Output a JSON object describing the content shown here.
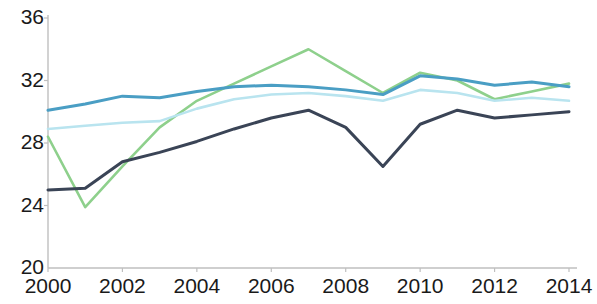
{
  "chart_data": {
    "type": "line",
    "title": "",
    "subtitle": "",
    "xlabel": "",
    "ylabel": "",
    "x": [
      2000,
      2001,
      2002,
      2003,
      2004,
      2005,
      2006,
      2007,
      2008,
      2009,
      2010,
      2011,
      2012,
      2013,
      2014
    ],
    "xlim": [
      2000,
      2014
    ],
    "ylim": [
      20,
      36
    ],
    "xticks": [
      2000,
      2002,
      2004,
      2006,
      2008,
      2010,
      2012,
      2014
    ],
    "xtick_labels": [
      "2000",
      "2002",
      "2004",
      "2006",
      "2008",
      "2010",
      "2012",
      "2014"
    ],
    "yticks": [
      20,
      24,
      28,
      32,
      36
    ],
    "ytick_labels": [
      "20",
      "24",
      "28",
      "32",
      "36"
    ],
    "grid": false,
    "legend": "none",
    "series": [
      {
        "name": "series-light-green",
        "color": "#8ed08c",
        "values": [
          28.4,
          23.9,
          26.5,
          29.0,
          30.7,
          31.8,
          32.9,
          34.0,
          32.6,
          31.2,
          32.5,
          32.0,
          30.8,
          31.3,
          31.8
        ]
      },
      {
        "name": "series-teal",
        "color": "#4a9ec4",
        "values": [
          30.1,
          30.5,
          31.0,
          30.9,
          31.3,
          31.6,
          31.7,
          31.6,
          31.4,
          31.1,
          32.3,
          32.1,
          31.7,
          31.9,
          31.6
        ]
      },
      {
        "name": "series-pale-cyan",
        "color": "#b9e4ef",
        "values": [
          28.9,
          29.1,
          29.3,
          29.4,
          30.2,
          30.8,
          31.1,
          31.2,
          31.0,
          30.7,
          31.4,
          31.2,
          30.7,
          30.9,
          30.7
        ]
      },
      {
        "name": "series-dark-navy",
        "color": "#3a4456",
        "values": [
          25.0,
          25.1,
          26.8,
          27.4,
          28.1,
          28.9,
          29.6,
          30.1,
          29.0,
          26.5,
          29.2,
          30.1,
          29.6,
          29.8,
          30.0
        ]
      }
    ]
  },
  "axis": {
    "line_color": "#bfbfbf",
    "tick_color": "#bfbfbf"
  }
}
